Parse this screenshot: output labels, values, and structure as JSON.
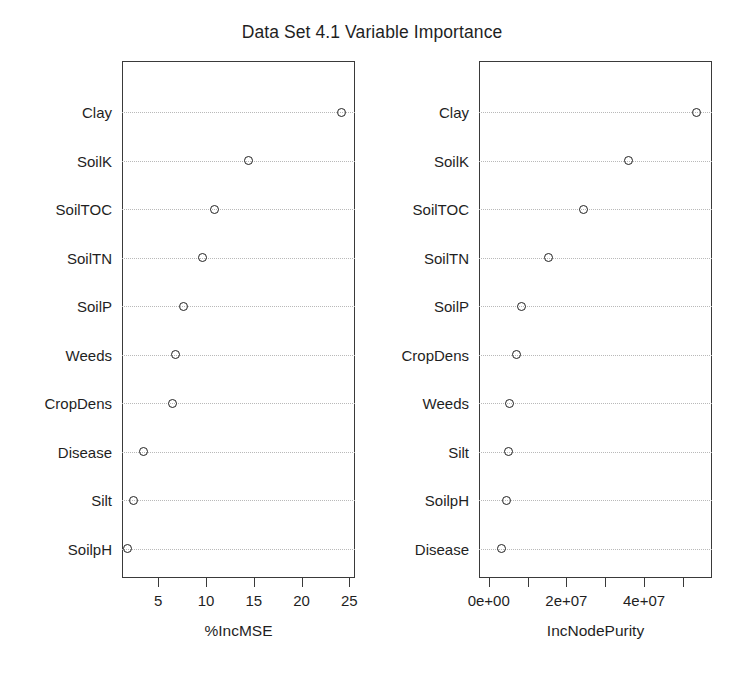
{
  "chart_data": {
    "type": "scatter",
    "title": "Data Set 4.1 Variable Importance",
    "grid": true,
    "legend": false,
    "panels": [
      {
        "name": "percent-inc-mse",
        "xlabel": "%IncMSE",
        "ylabel": "",
        "xlim": [
          1.2,
          25.6
        ],
        "xticks": [
          5,
          10,
          15,
          20,
          25
        ],
        "xticklabels": [
          "5",
          "10",
          "15",
          "20",
          "25"
        ],
        "categories": [
          "Clay",
          "SoilK",
          "SoilTOC",
          "SoilTN",
          "SoilP",
          "Weeds",
          "CropDens",
          "Disease",
          "Silt",
          "SoilpH"
        ],
        "values": [
          24.2,
          14.4,
          10.9,
          9.6,
          7.6,
          6.8,
          6.5,
          3.4,
          2.4,
          1.8
        ]
      },
      {
        "name": "inc-node-purity",
        "xlabel": "IncNodePurity",
        "ylabel": "",
        "xlim": [
          -2500000,
          57500000
        ],
        "xticks": [
          0,
          10000000,
          20000000,
          30000000,
          40000000,
          50000000
        ],
        "xticklabels": [
          "0e+00",
          "",
          "2e+07",
          "",
          "4e+07",
          ""
        ],
        "categories": [
          "Clay",
          "SoilK",
          "SoilTOC",
          "SoilTN",
          "SoilP",
          "CropDens",
          "Weeds",
          "Silt",
          "SoilpH",
          "Disease"
        ],
        "values": [
          53500000,
          36000000,
          24500000,
          15500000,
          8500000,
          7200000,
          5300000,
          5000000,
          4700000,
          3200000
        ]
      }
    ]
  },
  "title": "Data Set 4.1 Variable Importance"
}
